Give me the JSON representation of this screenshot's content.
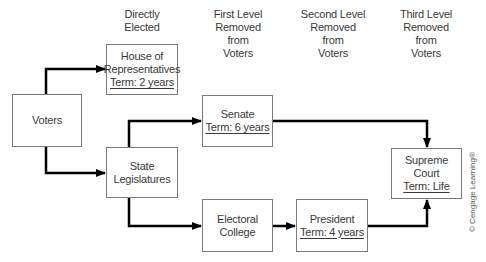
{
  "headers": [
    {
      "lines": [
        "Directly",
        "Elected"
      ]
    },
    {
      "lines": [
        "First Level",
        "Removed",
        "from",
        "Voters"
      ]
    },
    {
      "lines": [
        "Second Level",
        "Removed",
        "from",
        "Voters"
      ]
    },
    {
      "lines": [
        "Third Level",
        "Removed",
        "from",
        "Voters"
      ]
    }
  ],
  "nodes": {
    "voters": {
      "label": "Voters"
    },
    "house": {
      "label_1": "House of",
      "label_2": "Representatives",
      "term": "Term: 2 years"
    },
    "state_legislatures": {
      "label_1": "State",
      "label_2": "Legislatures"
    },
    "senate": {
      "label": "Senate",
      "term": "Term: 6 years"
    },
    "electoral_college": {
      "label_1": "Electoral",
      "label_2": "College"
    },
    "president": {
      "label": "President",
      "term": "Term: 4 years"
    },
    "supreme_court": {
      "label_1": "Supreme",
      "label_2": "Court",
      "term": "Term: Life"
    }
  },
  "edges": [
    {
      "from": "Voters",
      "to": "House of Representatives"
    },
    {
      "from": "Voters",
      "to": "State Legislatures"
    },
    {
      "from": "State Legislatures",
      "to": "Senate"
    },
    {
      "from": "State Legislatures",
      "to": "Electoral College"
    },
    {
      "from": "Electoral College",
      "to": "President"
    },
    {
      "from": "Senate",
      "to": "Supreme Court"
    },
    {
      "from": "President",
      "to": "Supreme Court"
    }
  ],
  "copyright": "© Cengage Learning®",
  "colors": {
    "line": "#000000",
    "box_border": "#7a7a7a",
    "text": "#3a3a3a"
  }
}
